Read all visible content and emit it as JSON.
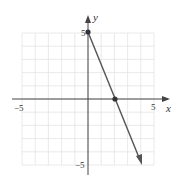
{
  "chart_data": {
    "type": "line",
    "title": "",
    "xlabel": "x",
    "ylabel": "y",
    "xlim": [
      -5,
      5
    ],
    "ylim": [
      -5,
      5
    ],
    "grid": true,
    "x_ticks_labeled": [
      "-5",
      "5"
    ],
    "y_ticks_labeled": [
      "5",
      "-5"
    ],
    "series": [
      {
        "name": "line",
        "equation": "y = -2.5x + 5",
        "x": [
          0,
          2,
          4
        ],
        "y": [
          5,
          0,
          -5
        ],
        "points_marked": [
          [
            0,
            5
          ],
          [
            2,
            0
          ]
        ],
        "arrow_end": [
          4,
          -5
        ],
        "color": "#555555"
      }
    ]
  },
  "labels": {
    "x_axis": "x",
    "y_axis": "y",
    "x_neg": "−5",
    "x_pos": "5",
    "y_pos": "5",
    "y_neg": "−5"
  }
}
